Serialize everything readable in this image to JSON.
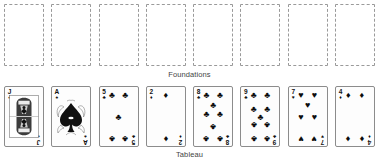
{
  "canvas": {
    "width": 379,
    "height": 163,
    "background": "#ffffff"
  },
  "labels": {
    "foundations": "Foundations",
    "tableau": "Tableau"
  },
  "colors": {
    "card_border": "#8c8c8c",
    "placeholder_border": "#9a9a9a",
    "pip_ink": "#0d0d0d",
    "label_text": "#444444",
    "card_face": "#fdfdfd"
  },
  "foundations": {
    "count": 8,
    "slots": [
      {
        "index": 1,
        "state": "empty"
      },
      {
        "index": 2,
        "state": "empty"
      },
      {
        "index": 3,
        "state": "empty"
      },
      {
        "index": 4,
        "state": "empty"
      },
      {
        "index": 5,
        "state": "empty"
      },
      {
        "index": 6,
        "state": "empty"
      },
      {
        "index": 7,
        "state": "empty"
      },
      {
        "index": 8,
        "state": "empty"
      }
    ]
  },
  "tableau": {
    "count": 8,
    "cards": [
      {
        "index": 1,
        "rank": "J",
        "suit": "spades",
        "suit_glyph": "♠",
        "label": "J♠",
        "face_up": true,
        "court": true
      },
      {
        "index": 2,
        "rank": "A",
        "suit": "spades",
        "suit_glyph": "♠",
        "label": "A♠",
        "face_up": true,
        "court": false
      },
      {
        "index": 3,
        "rank": "5",
        "suit": "clubs",
        "suit_glyph": "♣",
        "label": "5♣",
        "face_up": true,
        "court": false
      },
      {
        "index": 4,
        "rank": "2",
        "suit": "diamonds",
        "suit_glyph": "♦",
        "label": "2♦",
        "face_up": true,
        "court": false
      },
      {
        "index": 5,
        "rank": "8",
        "suit": "clubs",
        "suit_glyph": "♣",
        "label": "8♣",
        "face_up": true,
        "court": false
      },
      {
        "index": 6,
        "rank": "9",
        "suit": "clubs",
        "suit_glyph": "♣",
        "label": "9♣",
        "face_up": true,
        "court": false
      },
      {
        "index": 7,
        "rank": "7",
        "suit": "hearts",
        "suit_glyph": "♥",
        "label": "7♥",
        "face_up": true,
        "court": false
      },
      {
        "index": 8,
        "rank": "4",
        "suit": "diamonds",
        "suit_glyph": "♦",
        "label": "4♦",
        "face_up": true,
        "court": false
      }
    ]
  }
}
